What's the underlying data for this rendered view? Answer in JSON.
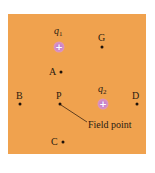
{
  "diagram": {
    "background_color": "#f0a24e",
    "charges": [
      {
        "id": "q1",
        "label_base": "q",
        "label_sub": "1",
        "sign": "+",
        "x": 59,
        "y": 47
      },
      {
        "id": "q2",
        "label_base": "q",
        "label_sub": "2",
        "sign": "+",
        "x": 103,
        "y": 104
      }
    ],
    "points": [
      {
        "id": "G",
        "label": "G",
        "x": 102,
        "y": 47
      },
      {
        "id": "A",
        "label": "A",
        "x": 61,
        "y": 72
      },
      {
        "id": "B",
        "label": "B",
        "x": 20,
        "y": 104
      },
      {
        "id": "P",
        "label": "P",
        "x": 60,
        "y": 104
      },
      {
        "id": "D",
        "label": "D",
        "x": 137,
        "y": 104
      },
      {
        "id": "C",
        "label": "C",
        "x": 63,
        "y": 142
      }
    ],
    "annotation": {
      "text": "Field point",
      "target": "P"
    }
  }
}
